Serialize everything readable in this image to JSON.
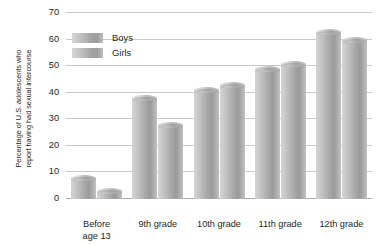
{
  "chart_data": {
    "type": "bar",
    "title": "",
    "xlabel": "",
    "ylabel": "Percentage of U.S. adolescents who report having had sexual intercourse",
    "ylabel_lines": [
      "Percentage of U.S. adolescents who",
      "report having had sexual intercourse"
    ],
    "categories": [
      "Before age 13",
      "9th grade",
      "10th grade",
      "11th grade",
      "12th grade"
    ],
    "category_lines": [
      [
        "Before",
        "age 13"
      ],
      [
        "9th grade"
      ],
      [
        "10th grade"
      ],
      [
        "11th grade"
      ],
      [
        "12th grade"
      ]
    ],
    "series": [
      {
        "name": "Boys",
        "values": [
          8,
          38,
          41,
          49,
          63
        ],
        "color": "#a9a9a9"
      },
      {
        "name": "Girls",
        "values": [
          3,
          28,
          43,
          51,
          60
        ],
        "color": "#a9a9a9"
      }
    ],
    "ylim": [
      0,
      70
    ],
    "yticks": [
      0,
      10,
      20,
      30,
      40,
      50,
      60,
      70
    ],
    "ytick_labels": [
      "0",
      "10",
      "20",
      "30",
      "40",
      "50",
      "60",
      "70"
    ],
    "grid": true,
    "legend_position": "upper-left-inside",
    "legend": [
      "Boys",
      "Girls"
    ]
  }
}
